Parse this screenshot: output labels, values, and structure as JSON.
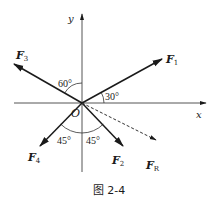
{
  "figure": {
    "caption": "图 2-4",
    "origin_label": "O",
    "axes": {
      "x_label": "x",
      "y_label": "y"
    },
    "forces": [
      {
        "id": "F1",
        "symbol": "F",
        "subscript": "1",
        "angle_deg": 30,
        "style": "solid"
      },
      {
        "id": "F2",
        "symbol": "F",
        "subscript": "2",
        "angle_deg": -45,
        "style": "solid"
      },
      {
        "id": "F3",
        "symbol": "F",
        "subscript": "3",
        "angle_deg": 150,
        "style": "solid"
      },
      {
        "id": "F4",
        "symbol": "F",
        "subscript": "4",
        "angle_deg": 225,
        "style": "solid"
      },
      {
        "id": "FR",
        "symbol": "F",
        "subscript": "R",
        "angle_deg": -30,
        "style": "dashed"
      }
    ],
    "angle_labels": [
      {
        "id": "a-f1",
        "text": "30°",
        "between": "x-axis and F1"
      },
      {
        "id": "a-f3",
        "text": "60°",
        "between": "y-axis and F3"
      },
      {
        "id": "a-f4",
        "text": "45°",
        "between": "negative y-axis and F4"
      },
      {
        "id": "a-f2",
        "text": "45°",
        "between": "negative y-axis and F2"
      }
    ]
  }
}
